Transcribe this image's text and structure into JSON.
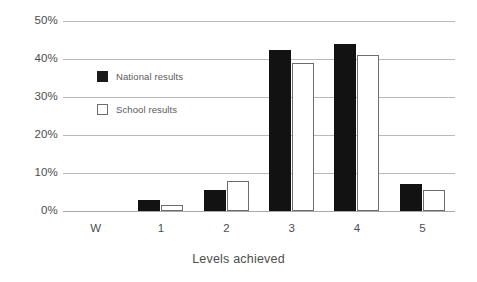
{
  "chart_data": {
    "type": "bar",
    "title": "",
    "subtitle": "",
    "xlabel": "Levels achieved",
    "ylabel": "",
    "categories": [
      "W",
      "1",
      "2",
      "3",
      "4",
      "5"
    ],
    "ylim": [
      0,
      50
    ],
    "yticks": [
      0,
      10,
      20,
      30,
      40,
      50
    ],
    "ytick_labels": [
      "0%",
      "10%",
      "20%",
      "30%",
      "40%",
      "50%"
    ],
    "grid": true,
    "legend_position": "inside-upper-left",
    "series": [
      {
        "name": "National results",
        "color": "#121212",
        "style": "filled",
        "values": [
          0,
          3,
          5.5,
          42.5,
          44,
          7
        ]
      },
      {
        "name": "School results",
        "color": "#ffffff",
        "style": "outlined",
        "values": [
          0,
          1.5,
          8,
          39,
          41,
          5.5
        ]
      }
    ]
  },
  "legend": {
    "items": [
      {
        "label": "National results",
        "swatch": "filled-square-icon"
      },
      {
        "label": "School results",
        "swatch": "outlined-square-icon"
      }
    ]
  },
  "axes": {
    "x_title": "Levels achieved"
  },
  "colors": {
    "national": "#121212",
    "school_outline": "#6d6d6d",
    "gridline": "#b9b9b9",
    "baseline": "#a8a8a8",
    "text": "#4d4d4d",
    "background": "#ffffff"
  }
}
